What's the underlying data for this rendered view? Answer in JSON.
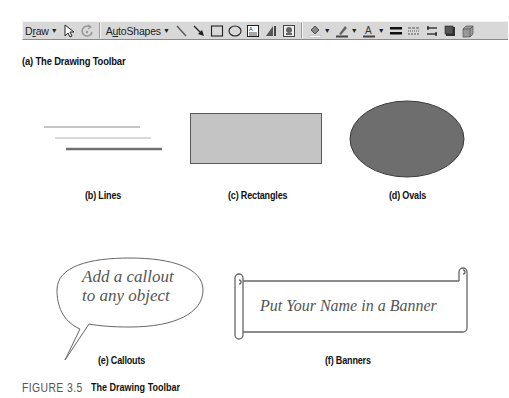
{
  "toolbar": {
    "draw_label": "Draw",
    "draw_underline": "r",
    "autoshapes_label": "AutoShapes",
    "icons": [
      "select-objects-arrow-icon",
      "free-rotate-icon",
      "line-icon",
      "arrow-icon",
      "rectangle-icon",
      "oval-icon",
      "text-box-icon",
      "wordart-icon",
      "clip-art-icon",
      "fill-color-icon",
      "line-color-icon",
      "font-color-icon",
      "line-style-icon",
      "dash-style-icon",
      "arrow-style-icon",
      "shadow-icon",
      "3d-icon"
    ],
    "dropdown_arrow": "▼"
  },
  "captions": {
    "a": "(a) The Drawing Toolbar",
    "b": "(b) Lines",
    "c": "(c) Rectangles",
    "d": "(d) Ovals",
    "e": "(e) Callouts",
    "f": "(f) Banners"
  },
  "callout": {
    "line1": "Add a callout",
    "line2": "to any object"
  },
  "banner": {
    "text": "Put Your Name in a Banner"
  },
  "colors": {
    "toolbar_bg": "#d8d8d8",
    "rectangle_fill": "#c4c4c4",
    "rectangle_stroke": "#5a5a5a",
    "oval_fill": "#6e6e6e",
    "oval_stroke": "#3a3a3a",
    "line1": "#8c8c8c",
    "line2": "#b4b4b4",
    "line3": "#707070"
  },
  "figure": {
    "number": "FIGURE 3.5",
    "title": "The Drawing Toolbar"
  }
}
